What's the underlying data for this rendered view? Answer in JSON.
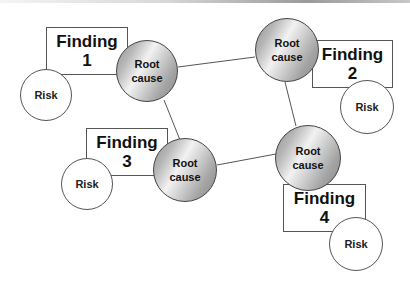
{
  "diagram": {
    "findings": [
      {
        "title": "Finding",
        "number": "1",
        "x": 46,
        "y": 27,
        "w": 82,
        "h": 48
      },
      {
        "title": "Finding",
        "number": "2",
        "x": 312,
        "y": 40,
        "w": 81,
        "h": 48
      },
      {
        "title": "Finding",
        "number": "3",
        "x": 86,
        "y": 128,
        "w": 82,
        "h": 48
      },
      {
        "title": "Finding",
        "number": "4",
        "x": 283,
        "y": 184,
        "w": 83,
        "h": 48
      }
    ],
    "root_causes": [
      {
        "line1": "Root",
        "line2": "cause",
        "cx": 147,
        "cy": 71,
        "r": 31
      },
      {
        "line1": "Root",
        "line2": "cause",
        "cx": 287,
        "cy": 50,
        "r": 32
      },
      {
        "line1": "Root",
        "line2": "cause",
        "cx": 185,
        "cy": 170,
        "r": 32
      },
      {
        "line1": "Root",
        "line2": "cause",
        "cx": 308,
        "cy": 158,
        "r": 33
      }
    ],
    "risks": [
      {
        "label": "Risk",
        "cx": 46,
        "cy": 95,
        "r": 26
      },
      {
        "label": "Risk",
        "cx": 367,
        "cy": 107,
        "r": 27
      },
      {
        "label": "Risk",
        "cx": 87,
        "cy": 184,
        "r": 26
      },
      {
        "label": "Risk",
        "cx": 356,
        "cy": 244,
        "r": 27
      }
    ],
    "links": [
      {
        "from": "root-cause-1",
        "to": "root-cause-2"
      },
      {
        "from": "root-cause-1",
        "to": "root-cause-3"
      },
      {
        "from": "root-cause-2",
        "to": "root-cause-4"
      },
      {
        "from": "root-cause-3",
        "to": "root-cause-4"
      }
    ],
    "colors": {
      "stroke": "#555555",
      "root_light": "#f2f2f2",
      "root_dark": "#8a8a8a"
    }
  }
}
